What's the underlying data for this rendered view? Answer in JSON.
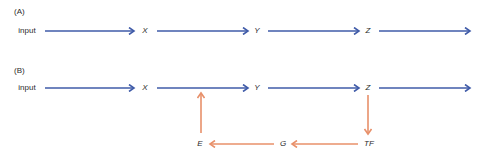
{
  "panels": [
    {
      "label": "(A)",
      "nodes": {
        "input": "input",
        "x": "X",
        "y": "Y",
        "z": "Z"
      }
    },
    {
      "label": "(B)",
      "nodes": {
        "input": "input",
        "x": "X",
        "y": "Y",
        "z": "Z",
        "tf": "TF",
        "g": "G",
        "e": "E"
      }
    }
  ],
  "colors": {
    "forward_arrow": "#3f5ba8",
    "feedback_arrow": "#e8906a",
    "text": "#2b2b2b"
  }
}
